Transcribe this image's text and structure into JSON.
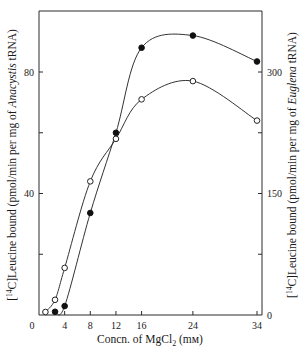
{
  "chart_data": {
    "type": "line",
    "title": "",
    "xlabel": "Concn. of MgCl2 (mM)",
    "xlabel_parts": {
      "prefix": "Concn. of MgCl",
      "sub": "2",
      "suffix": " (mм)"
    },
    "ylabel_left": "[14C]Leucine bound (pmol/min per mg of Anacystis tRNA)",
    "ylabel_left_parts": {
      "open": "[",
      "sup": "14",
      "pre": "C]Leucine bound (pmol/min per mg of ",
      "italic": "Anacystis",
      "post": " tRNA)"
    },
    "ylabel_right": "[14C]Leucine bound (pmol/min per mg of Euglena tRNA)",
    "ylabel_right_parts": {
      "open": "[",
      "sup": "14",
      "pre": "C]Leucine bound (pmol/min per mg of ",
      "italic": "Euglena",
      "post": " tRNA)"
    },
    "x_ticks": [
      0,
      4,
      8,
      12,
      16,
      24,
      34
    ],
    "x_tick_labels": [
      "0",
      "4",
      "8",
      "12",
      "16",
      "24",
      "34"
    ],
    "xlim": [
      0,
      34.5
    ],
    "y_left_ticks": [
      0,
      20,
      40,
      60,
      80
    ],
    "y_left_tick_labels": [
      "",
      "",
      "40",
      "",
      "80"
    ],
    "ylim_left": [
      0,
      80
    ],
    "y_right_ticks": [
      0,
      75,
      150,
      225,
      300
    ],
    "y_right_tick_labels": [
      "0",
      "",
      "150",
      "",
      "300"
    ],
    "ylim_right": [
      0,
      300
    ],
    "grid": false,
    "legend": null,
    "series": [
      {
        "name": "Anacystis tRNA",
        "marker": "open-circle",
        "axis": "left",
        "x": [
          1,
          2.5,
          4,
          8,
          12,
          16,
          24,
          34
        ],
        "values": [
          1,
          5,
          15.5,
          44,
          58,
          71,
          77,
          64
        ]
      },
      {
        "name": "Euglena tRNA",
        "marker": "filled-circle",
        "axis": "right",
        "x": [
          2.5,
          4,
          8,
          12,
          16,
          24,
          34
        ],
        "values": [
          4,
          11,
          126,
          225,
          330,
          345,
          313
        ]
      }
    ]
  }
}
